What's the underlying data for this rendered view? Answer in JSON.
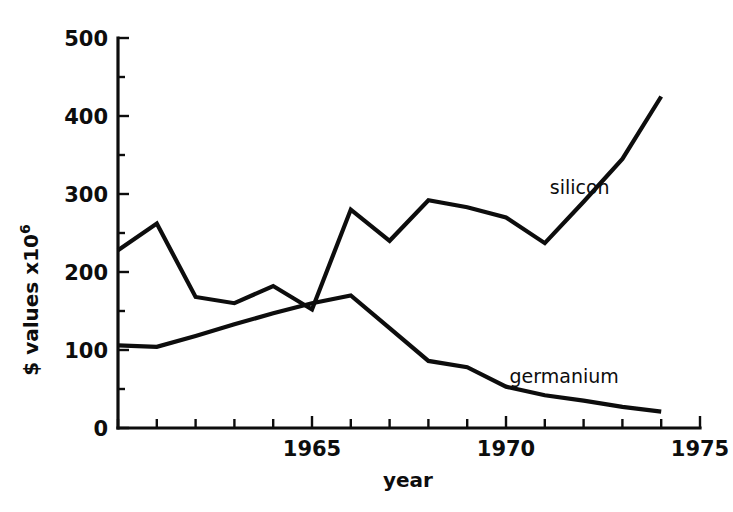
{
  "chart_data": {
    "type": "line",
    "title": "",
    "subtitle": "",
    "xlabel": "year",
    "ylabel": "$ values x10",
    "ylabel_superscript": "6",
    "xlim": [
      1960,
      1975
    ],
    "ylim": [
      0,
      500
    ],
    "grid": false,
    "legend_position": "inline-end-of-line",
    "x_tick_labels": [
      "1965",
      "1970",
      "1975"
    ],
    "x_tick_label_values": [
      1965,
      1970,
      1975
    ],
    "x_minor_tick_values": [
      1960,
      1961,
      1962,
      1963,
      1964,
      1965,
      1966,
      1967,
      1968,
      1969,
      1970,
      1971,
      1972,
      1973,
      1974,
      1975
    ],
    "y_tick_labels": [
      "0",
      "100",
      "200",
      "300",
      "400",
      "500"
    ],
    "y_tick_values": [
      0,
      100,
      200,
      300,
      400,
      500
    ],
    "y_minor_tick_values": [
      50,
      150,
      250,
      350,
      450
    ],
    "x": [
      1960,
      1961,
      1962,
      1963,
      1964,
      1965,
      1966,
      1967,
      1968,
      1969,
      1970,
      1971,
      1972,
      1973,
      1974
    ],
    "series": [
      {
        "name": "silicon",
        "label": "silicon",
        "color": "#0d0d0d",
        "values": [
          228,
          262,
          168,
          160,
          182,
          152,
          280,
          240,
          292,
          283,
          270,
          237,
          290,
          345,
          425
        ]
      },
      {
        "name": "germanium",
        "label": "germanium",
        "color": "#0d0d0d",
        "values": [
          106,
          104,
          118,
          133,
          147,
          160,
          170,
          128,
          86,
          78,
          53,
          42,
          35,
          27,
          21
        ]
      }
    ],
    "annotations": [
      {
        "text": "silicon",
        "x": 1971.9,
        "y": 300
      },
      {
        "text": "germanium",
        "x": 1971.5,
        "y": 58
      }
    ]
  }
}
